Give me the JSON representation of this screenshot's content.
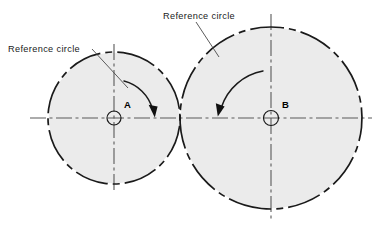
{
  "diagram": {
    "canvas": {
      "width": 379,
      "height": 230
    },
    "background_color": "#ffffff",
    "fill_color": "#ebebeb",
    "line_color": "#1a1a1a",
    "centerline_color": "#4a4a4a",
    "labels": [
      {
        "id": "left-reference-circle",
        "text": "Reference circle",
        "x": 8,
        "y": 52,
        "leader_from": [
          92,
          49
        ],
        "leader_to": [
          128,
          88
        ]
      },
      {
        "id": "right-reference-circle",
        "text": "Reference circle",
        "x": 163,
        "y": 19,
        "leader_from": [
          196,
          22
        ],
        "leader_to": [
          219,
          56
        ]
      }
    ],
    "circles": [
      {
        "id": "circle-a",
        "center_label": "A",
        "cx": 114,
        "cy": 118,
        "r": 66,
        "hub_r": 7,
        "label_x": 124,
        "label_y": 107,
        "linestyle": "dash-dot",
        "rotation": "clockwise"
      },
      {
        "id": "circle-b",
        "center_label": "B",
        "cx": 271,
        "cy": 118,
        "r": 91,
        "hub_r": 7.5,
        "label_x": 282,
        "label_y": 107,
        "linestyle": "dash-dot",
        "rotation": "counter-clockwise"
      }
    ],
    "centerlines": [
      {
        "id": "horizontal-centerline",
        "x1": 30,
        "y1": 118,
        "x2": 372,
        "y2": 118
      },
      {
        "id": "vertical-centerline-a",
        "x1": 114,
        "y1": 44,
        "x2": 114,
        "y2": 193
      },
      {
        "id": "vertical-centerline-b",
        "x1": 271,
        "y1": 14,
        "x2": 271,
        "y2": 222
      }
    ],
    "rotation_arrows": [
      {
        "id": "rotation-arrow-a",
        "direction": "clockwise",
        "path": "M 124 81 A 38 38 0 0 1 152 110",
        "arrow_tip": [
          154.5,
          117
        ],
        "arrow_left": [
          149.5,
          106
        ],
        "arrow_right": [
          157,
          108
        ]
      },
      {
        "id": "rotation-arrow-b",
        "direction": "counter-clockwise",
        "path": "M 262 72 A 52 52 0 0 0 221 108",
        "arrow_tip": [
          218.5,
          116
        ],
        "arrow_left": [
          216.5,
          104
        ],
        "arrow_right": [
          224,
          107
        ]
      }
    ],
    "tangent_point": {
      "x": 180,
      "y": 118
    }
  }
}
